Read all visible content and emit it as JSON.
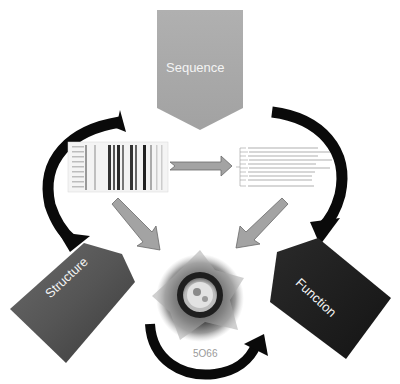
{
  "diagram": {
    "nodes": {
      "sequence": {
        "label": "Sequence",
        "color": "#a8a8a8"
      },
      "structure": {
        "label": "Structure",
        "color": "#5a5a5a"
      },
      "function": {
        "label": "Function",
        "color": "#1c1c1c"
      }
    },
    "center": {
      "label": "5O66",
      "description": "protein-structure-image"
    },
    "panels": {
      "alignment": "multiple-sequence-alignment",
      "tree": "phylogenetic-tree"
    },
    "colors": {
      "curved_arrow": "#0a0a0a",
      "block_arrow_fill": "#a0a0a0",
      "block_arrow_stroke": "#6a6a6a"
    }
  }
}
